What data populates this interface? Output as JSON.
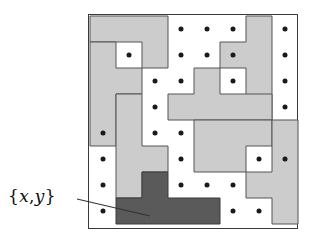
{
  "figure": {
    "kind": "polyomino-packing-diagram",
    "title": "",
    "annotation": {
      "label": "{x,y}",
      "label_open_brace": "{",
      "label_x": "x",
      "label_comma": ",",
      "label_y": "y",
      "label_close_brace": "}",
      "leader_from": [
        77,
        199
      ],
      "leader_to": [
        150,
        216
      ]
    }
  },
  "board": {
    "rows": 8,
    "cols": 8,
    "cell": 26,
    "origin": [
      1,
      1
    ],
    "border_color": "#3a3a3a",
    "background": "#ffffff"
  },
  "colors": {
    "piece_fill": "#cccccc",
    "piece_stroke": "#555555",
    "highlight_fill": "#5a5a5a",
    "highlight_stroke": "#3a3a3a",
    "dot_color": "#1a1a1a",
    "frame_color": "#3a3a3a",
    "leader_color": "#333333",
    "label_color": "#0d0d0d",
    "page_background": "#ffffff"
  },
  "pieces": [
    {
      "id": "piece-a",
      "name": "top-left-tetromino",
      "highlight": false,
      "cells": [
        [
          0,
          0
        ],
        [
          0,
          1
        ],
        [
          0,
          2
        ],
        [
          1,
          2
        ]
      ]
    },
    {
      "id": "piece-b",
      "name": "left-edge-piece",
      "highlight": false,
      "cells": [
        [
          1,
          0
        ],
        [
          2,
          0
        ],
        [
          3,
          0
        ],
        [
          4,
          0
        ],
        [
          2,
          1
        ]
      ]
    },
    {
      "id": "piece-c",
      "name": "upper-right-zigzag",
      "highlight": false,
      "cells": [
        [
          0,
          6
        ],
        [
          1,
          6
        ],
        [
          1,
          5
        ],
        [
          2,
          6
        ],
        [
          3,
          6
        ]
      ]
    },
    {
      "id": "piece-d",
      "name": "center-tee",
      "highlight": false,
      "cells": [
        [
          2,
          4
        ],
        [
          3,
          3
        ],
        [
          3,
          4
        ],
        [
          3,
          5
        ],
        [
          3,
          6
        ]
      ]
    },
    {
      "id": "piece-e",
      "name": "lower-center-tee",
      "highlight": false,
      "cells": [
        [
          4,
          4
        ],
        [
          4,
          5
        ],
        [
          4,
          6
        ],
        [
          5,
          4
        ],
        [
          5,
          5
        ]
      ]
    },
    {
      "id": "piece-f",
      "name": "left-vertical-bar",
      "highlight": false,
      "cells": [
        [
          3,
          1
        ],
        [
          4,
          1
        ],
        [
          5,
          1
        ],
        [
          6,
          1
        ],
        [
          5,
          2
        ]
      ]
    },
    {
      "id": "piece-g",
      "name": "right-edge-piece",
      "highlight": false,
      "cells": [
        [
          4,
          7
        ],
        [
          5,
          7
        ],
        [
          6,
          7
        ],
        [
          7,
          7
        ],
        [
          6,
          6
        ]
      ]
    },
    {
      "id": "piece-h",
      "name": "highlighted-tee",
      "highlight": true,
      "cells": [
        [
          6,
          2
        ],
        [
          7,
          1
        ],
        [
          7,
          2
        ],
        [
          7,
          3
        ],
        [
          7,
          4
        ]
      ]
    }
  ],
  "dots": [
    [
      0,
      3
    ],
    [
      0,
      4
    ],
    [
      0,
      5
    ],
    [
      0,
      7
    ],
    [
      1,
      1
    ],
    [
      1,
      3
    ],
    [
      1,
      4
    ],
    [
      1,
      5
    ],
    [
      1,
      7
    ],
    [
      2,
      2
    ],
    [
      2,
      3
    ],
    [
      2,
      5
    ],
    [
      2,
      7
    ],
    [
      3,
      2
    ],
    [
      3,
      7
    ],
    [
      4,
      0
    ],
    [
      4,
      2
    ],
    [
      4,
      3
    ],
    [
      5,
      0
    ],
    [
      5,
      3
    ],
    [
      5,
      6
    ],
    [
      5,
      7
    ],
    [
      6,
      0
    ],
    [
      6,
      3
    ],
    [
      6,
      4
    ],
    [
      6,
      5
    ],
    [
      7,
      0
    ],
    [
      7,
      5
    ],
    [
      7,
      6
    ]
  ]
}
